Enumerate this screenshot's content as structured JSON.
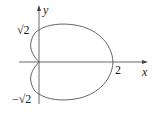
{
  "figure": {
    "axes": {
      "x_label": "x",
      "y_label": "y"
    },
    "ticks": {
      "x_tick": "2",
      "y_top": "√2",
      "y_bottom": "−√2"
    },
    "curve": {
      "description": "heart/cardioid-like closed curve with cusp at origin",
      "points": [
        {
          "label": "x-intercept",
          "value": "2"
        },
        {
          "label": "y-intercept top",
          "value": "√2"
        },
        {
          "label": "y-intercept bottom",
          "value": "−√2"
        }
      ]
    }
  }
}
